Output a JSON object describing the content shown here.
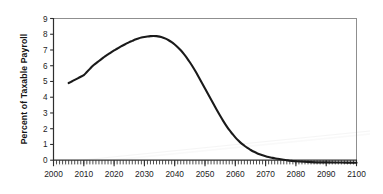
{
  "chart_data": {
    "type": "line",
    "title": "",
    "subtitle": "",
    "xlabel": "",
    "ylabel": "Percent of Taxable Payroll",
    "xlim": [
      2000,
      2100
    ],
    "ylim": [
      0,
      9
    ],
    "grid": false,
    "legend": null,
    "legend_position": "none",
    "x_tick_labels": [
      "2000",
      "2010",
      "2020",
      "2030",
      "2040",
      "2050",
      "2060",
      "2070",
      "2080",
      "2090",
      "2100"
    ],
    "x_ticks": [
      2000,
      2010,
      2020,
      2030,
      2040,
      2050,
      2060,
      2070,
      2080,
      2090,
      2100
    ],
    "x_minor_tick_interval": 1,
    "y_tick_labels": [
      "0",
      "1",
      "2",
      "3",
      "4",
      "5",
      "6",
      "7",
      "8",
      "9"
    ],
    "y_ticks": [
      0,
      1,
      2,
      3,
      4,
      5,
      6,
      7,
      8,
      9
    ],
    "series": [
      {
        "name": "Cost rate minus income rate",
        "color": "#1a1a1a",
        "line_width": 2.1,
        "x": [
          2005,
          2006,
          2007,
          2008,
          2009,
          2010,
          2011,
          2012,
          2013,
          2014,
          2015,
          2016,
          2017,
          2018,
          2019,
          2020,
          2021,
          2022,
          2023,
          2024,
          2025,
          2026,
          2027,
          2028,
          2029,
          2030,
          2031,
          2032,
          2033,
          2034,
          2035,
          2036,
          2037,
          2038,
          2039,
          2040,
          2041,
          2042,
          2043,
          2044,
          2045,
          2046,
          2047,
          2048,
          2049,
          2050,
          2051,
          2052,
          2053,
          2054,
          2055,
          2056,
          2057,
          2058,
          2059,
          2060,
          2061,
          2062,
          2063,
          2064,
          2065,
          2066,
          2067,
          2068,
          2069,
          2070,
          2071,
          2072,
          2073,
          2074,
          2075,
          2076,
          2077,
          2078,
          2079,
          2080,
          2085,
          2090,
          2095,
          2100
        ],
        "values": [
          4.9,
          5.0,
          5.1,
          5.2,
          5.3,
          5.4,
          5.6,
          5.8,
          6.0,
          6.15,
          6.3,
          6.45,
          6.6,
          6.72,
          6.85,
          6.97,
          7.08,
          7.2,
          7.3,
          7.4,
          7.5,
          7.58,
          7.66,
          7.73,
          7.79,
          7.83,
          7.86,
          7.88,
          7.89,
          7.88,
          7.85,
          7.8,
          7.72,
          7.62,
          7.5,
          7.35,
          7.18,
          6.98,
          6.75,
          6.5,
          6.22,
          5.92,
          5.6,
          5.25,
          4.9,
          4.55,
          4.2,
          3.85,
          3.5,
          3.15,
          2.82,
          2.5,
          2.2,
          1.92,
          1.68,
          1.45,
          1.25,
          1.07,
          0.92,
          0.78,
          0.66,
          0.55,
          0.46,
          0.38,
          0.31,
          0.25,
          0.2,
          0.16,
          0.12,
          0.09,
          0.06,
          0.03,
          0.0,
          -0.03,
          -0.05,
          -0.07,
          -0.12,
          -0.14,
          -0.15,
          -0.16
        ]
      }
    ],
    "annotations": [],
    "peak": {
      "year": 2033,
      "value": 7.9
    },
    "start": {
      "year": 2005,
      "value": 4.9
    },
    "zero_crossing_year": 2077
  },
  "style": {
    "line_color": "#1a1a1a",
    "axis_color": "#3a3a3a",
    "frame_color": "#8a8a8a",
    "tick_color": "#2e2e2e",
    "background": "#ffffff"
  }
}
